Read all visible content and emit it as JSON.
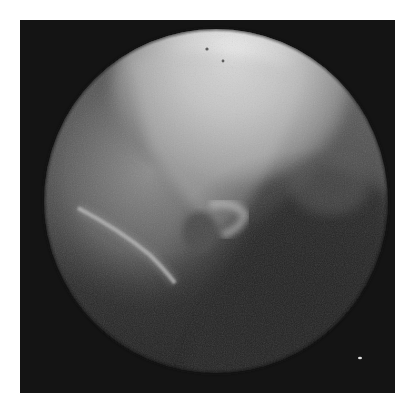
{
  "image": {
    "kind": "fluoroscopy",
    "description": "Circular fluoroscopic/radiographic field of view on a dark square background showing a bright upper region, a curved bony contour and a rounded dark structure near center",
    "background_color": "#ffffff",
    "frame_color": "#141414",
    "field_of_view": {
      "shape": "circle",
      "center_x": 216,
      "center_y": 201,
      "radius": 172
    },
    "features": [
      {
        "name": "bright-upper-region",
        "color": "#e8e8e8"
      },
      {
        "name": "curved-bright-line",
        "color": "#bdbdbd"
      },
      {
        "name": "rounded-dark-structure",
        "color": "#555555"
      },
      {
        "name": "white-speck",
        "x": 360,
        "y": 358
      }
    ]
  }
}
